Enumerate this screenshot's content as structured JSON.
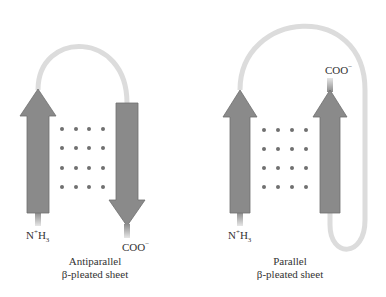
{
  "colors": {
    "strand_fill": "#8a8a8a",
    "strand_stroke": "#6f6f6f",
    "loop": "#dcdcdc",
    "hbond_dot": "#707070",
    "text": "#333333"
  },
  "panels": [
    {
      "id": "antiparallel",
      "caption_line1": "Antiparallel",
      "caption_line2": "β-pleated sheet",
      "n_terminus_label": "N",
      "n_terminus_sup": "+",
      "n_terminus_h": "H",
      "n_terminus_sub": "3",
      "c_terminus_label": "COO",
      "c_terminus_sup": "−",
      "strands": [
        {
          "name": "strand-1",
          "direction": "up"
        },
        {
          "name": "strand-2",
          "direction": "down"
        }
      ],
      "hbond_grid": {
        "rows": 4,
        "cols": 4
      }
    },
    {
      "id": "parallel",
      "caption_line1": "Parallel",
      "caption_line2": "β-pleated sheet",
      "n_terminus_label": "N",
      "n_terminus_sup": "+",
      "n_terminus_h": "H",
      "n_terminus_sub": "3",
      "c_terminus_label": "COO",
      "c_terminus_sup": "−",
      "strands": [
        {
          "name": "strand-1",
          "direction": "up"
        },
        {
          "name": "strand-2",
          "direction": "up"
        }
      ],
      "hbond_grid": {
        "rows": 4,
        "cols": 4
      }
    }
  ]
}
